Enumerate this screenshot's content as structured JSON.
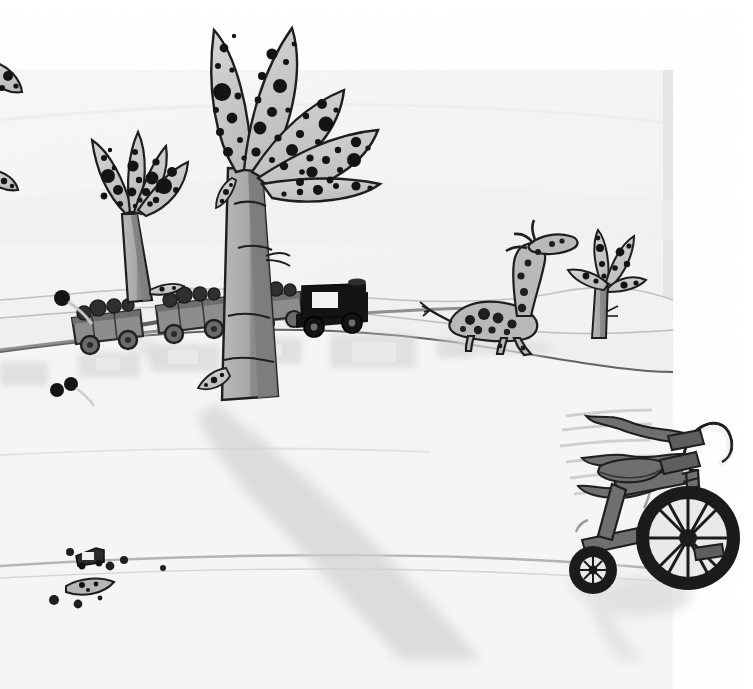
{
  "artwork": {
    "title": "Spotted Savanna with Toy Train and Tricycle",
    "medium": "ink-and-wash-drawing",
    "domain_note": "scanned-book-illustration",
    "canvas": {
      "width": 753,
      "height": 689
    },
    "paper": {
      "sheet_color": "#f4f4f3",
      "outside_color": "#ffffff",
      "sheet_left": 0,
      "sheet_top": 70,
      "sheet_right": 673,
      "sheet_bottom": 660,
      "note": "scanned page corner visible at upper-right and lower-right"
    },
    "palette": {
      "ink": "#1a1a1a",
      "leaf_fill": "#c9c9c9",
      "trunk_light": "#b4b4b4",
      "trunk_dark": "#8f8f8f",
      "train_body": "#8d8d8d",
      "train_dark": "#5e5e5e",
      "locomotive": "#151515",
      "shadow": "#d9d9d9",
      "shadow_soft": "#e4e4e4",
      "ground_line": "#9a9a9a",
      "sky": "#f6f6f5"
    }
  },
  "scene": {
    "ground": {
      "label": "Rolling savanna ground",
      "horizon_y": 330,
      "hill_crest_y": 345
    },
    "trees": [
      {
        "id": "tree-main",
        "label": "Large spotted palm tree",
        "trunk_base_x": 255,
        "trunk_base_y": 400,
        "leaf_count": 5,
        "spot_color": "#121212"
      },
      {
        "id": "tree-second",
        "label": "Second spotted palm tree",
        "trunk_base_x": 130,
        "trunk_base_y": 300,
        "leaf_count": 4
      },
      {
        "id": "tree-edge",
        "label": "Cropped palm leaves at left edge",
        "leaf_count": 2
      },
      {
        "id": "tree-small-right",
        "label": "Small spotted tree browsed by giraffe",
        "trunk_base_x": 598,
        "trunk_base_y": 335,
        "leaf_count": 4
      }
    ],
    "animals": [
      {
        "id": "giraffe",
        "label": "Spotted giraffe eating leaves",
        "x": 470,
        "y": 240,
        "facing": "right",
        "spots": true
      }
    ],
    "toys": [
      {
        "id": "toy-train",
        "label": "Toy train on the hillside",
        "cars": [
          {
            "id": "car-1",
            "label": "Rear gondola car",
            "x": 96,
            "y": 322,
            "loaded": true,
            "color": "#8d8d8d"
          },
          {
            "id": "car-2",
            "label": "Middle gondola car",
            "x": 190,
            "y": 310,
            "loaded": true,
            "color": "#8d8d8d"
          },
          {
            "id": "car-3",
            "label": "Front gondola car",
            "x": 268,
            "y": 302,
            "loaded": true,
            "color": "#8d8d8d"
          },
          {
            "id": "locomotive",
            "label": "Black locomotive with smokestack",
            "x": 325,
            "y": 300,
            "loaded": false,
            "color": "#151515"
          }
        ]
      },
      {
        "id": "tricycle",
        "label": "Tricycle with handlebar streamers",
        "x": 650,
        "y": 510,
        "front_wheel_r": 40,
        "rear_wheel_r": 23,
        "streamer_count": 3,
        "motion_lines": true
      },
      {
        "id": "toy-car",
        "label": "Tiny toy car on the ground",
        "x": 88,
        "y": 560
      }
    ],
    "props": [
      {
        "id": "marble-1",
        "label": "Black marble",
        "x": 62,
        "y": 298,
        "r": 7
      },
      {
        "id": "marble-2",
        "label": "Black marble",
        "x": 58,
        "y": 388,
        "r": 6
      },
      {
        "id": "marble-3",
        "label": "Black marble",
        "x": 70,
        "y": 383,
        "r": 6
      },
      {
        "id": "pebble-1",
        "label": "Small pebble",
        "x": 70,
        "y": 552,
        "r": 4
      },
      {
        "id": "pebble-2",
        "label": "Small pebble",
        "x": 105,
        "y": 565,
        "r": 4
      },
      {
        "id": "pebble-3",
        "label": "Small pebble",
        "x": 118,
        "y": 560,
        "r": 4
      },
      {
        "id": "pebble-4",
        "label": "Small pebble",
        "x": 160,
        "y": 568,
        "r": 3
      },
      {
        "id": "pebble-5",
        "label": "Small pebble",
        "x": 55,
        "y": 598,
        "r": 5
      },
      {
        "id": "pebble-6",
        "label": "Small pebble",
        "x": 78,
        "y": 602,
        "r": 4
      },
      {
        "id": "leaf-ground",
        "label": "Fallen spotted leaf",
        "x": 92,
        "y": 588
      }
    ],
    "shadows": [
      {
        "id": "shadow-tree-main",
        "label": "Long shadow of the main tree"
      },
      {
        "id": "shadow-train",
        "label": "Shadow of the toy train"
      },
      {
        "id": "shadow-tricycle",
        "label": "Shadow of the tricycle"
      }
    ]
  }
}
